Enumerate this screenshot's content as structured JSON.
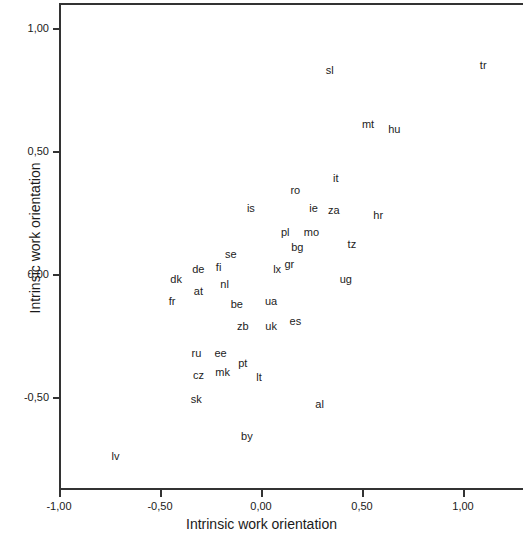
{
  "chart_data": {
    "type": "scatter",
    "title": "",
    "xlabel": "Intrinsic work orientation",
    "ylabel": "Intrinsic work orientation",
    "xlim": [
      -1.15,
      1.15
    ],
    "ylim": [
      -0.93,
      1.08
    ],
    "grid": false,
    "legend": null,
    "xticks": [
      -1.0,
      -0.5,
      0.0,
      0.5,
      1.0
    ],
    "xticklabels": [
      "-1,00",
      "-0,50",
      "0,00",
      "0,50",
      "1,00"
    ],
    "yticks": [
      1.0,
      0.5,
      0.0,
      -0.5
    ],
    "yticklabels": [
      "1,00",
      "0,50",
      "0,00",
      "-0,50"
    ],
    "point_style": "text-label-only",
    "points": [
      {
        "label": "sl",
        "x": 0.34,
        "y": 0.83
      },
      {
        "label": "tr",
        "x": 1.1,
        "y": 0.85
      },
      {
        "label": "mt",
        "x": 0.53,
        "y": 0.61
      },
      {
        "label": "hu",
        "x": 0.66,
        "y": 0.59
      },
      {
        "label": "it",
        "x": 0.37,
        "y": 0.39
      },
      {
        "label": "ro",
        "x": 0.17,
        "y": 0.34
      },
      {
        "label": "is",
        "x": -0.05,
        "y": 0.27
      },
      {
        "label": "ie",
        "x": 0.26,
        "y": 0.27
      },
      {
        "label": "za",
        "x": 0.36,
        "y": 0.26
      },
      {
        "label": "hr",
        "x": 0.58,
        "y": 0.24
      },
      {
        "label": "pl",
        "x": 0.12,
        "y": 0.17
      },
      {
        "label": "mo",
        "x": 0.25,
        "y": 0.17
      },
      {
        "label": "bg",
        "x": 0.18,
        "y": 0.11
      },
      {
        "label": "tz",
        "x": 0.45,
        "y": 0.12
      },
      {
        "label": "se",
        "x": -0.15,
        "y": 0.08
      },
      {
        "label": "fi",
        "x": -0.21,
        "y": 0.03
      },
      {
        "label": "gr",
        "x": 0.14,
        "y": 0.04
      },
      {
        "label": "lx",
        "x": 0.08,
        "y": 0.02
      },
      {
        "label": "de",
        "x": -0.31,
        "y": 0.02
      },
      {
        "label": "dk",
        "x": -0.42,
        "y": -0.02
      },
      {
        "label": "nl",
        "x": -0.18,
        "y": -0.04
      },
      {
        "label": "ug",
        "x": 0.42,
        "y": -0.02
      },
      {
        "label": "at",
        "x": -0.31,
        "y": -0.07
      },
      {
        "label": "fr",
        "x": -0.44,
        "y": -0.11
      },
      {
        "label": "be",
        "x": -0.12,
        "y": -0.12
      },
      {
        "label": "ua",
        "x": 0.05,
        "y": -0.11
      },
      {
        "label": "zb",
        "x": -0.09,
        "y": -0.21
      },
      {
        "label": "uk",
        "x": 0.05,
        "y": -0.21
      },
      {
        "label": "es",
        "x": 0.17,
        "y": -0.19
      },
      {
        "label": "ru",
        "x": -0.32,
        "y": -0.32
      },
      {
        "label": "ee",
        "x": -0.2,
        "y": -0.32
      },
      {
        "label": "pt",
        "x": -0.09,
        "y": -0.36
      },
      {
        "label": "cz",
        "x": -0.31,
        "y": -0.41
      },
      {
        "label": "mk",
        "x": -0.19,
        "y": -0.4
      },
      {
        "label": "lt",
        "x": -0.01,
        "y": -0.42
      },
      {
        "label": "sk",
        "x": -0.32,
        "y": -0.51
      },
      {
        "label": "al",
        "x": 0.29,
        "y": -0.53
      },
      {
        "label": "by",
        "x": -0.07,
        "y": -0.66
      },
      {
        "label": "lv",
        "x": -0.72,
        "y": -0.74
      }
    ]
  },
  "axes": {
    "x_title": "Intrinsic work orientation",
    "y_title": "Intrinsic work orientation",
    "x_tick_labels": [
      "-1,00",
      "-0,50",
      "0,00",
      "0,50",
      "1,00"
    ],
    "y_tick_labels": [
      "1,00",
      "0,50",
      "0,00",
      "-0,50"
    ]
  }
}
